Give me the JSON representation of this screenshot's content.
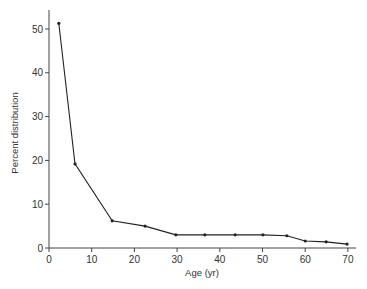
{
  "chart_data": {
    "type": "line",
    "title": "",
    "xlabel": "Age (yr)",
    "ylabel": "Percent distribution",
    "xlim": [
      0,
      72
    ],
    "ylim": [
      0,
      55
    ],
    "grid": false,
    "legend": null,
    "x_ticks": [
      0,
      10,
      20,
      30,
      40,
      50,
      60,
      70
    ],
    "y_ticks": [
      0,
      10,
      20,
      30,
      40,
      50
    ],
    "series": [
      {
        "name": "Percent distribution",
        "marker": "dot",
        "color": "#222222",
        "x": [
          2.3,
          6.1,
          14.8,
          22.5,
          29.7,
          36.5,
          43.6,
          50.1,
          55.7,
          60.0,
          64.9,
          69.8
        ],
        "values": [
          51.3,
          19.2,
          6.2,
          5.0,
          3.0,
          3.0,
          3.0,
          3.0,
          2.8,
          1.6,
          1.4,
          0.9
        ]
      }
    ]
  }
}
